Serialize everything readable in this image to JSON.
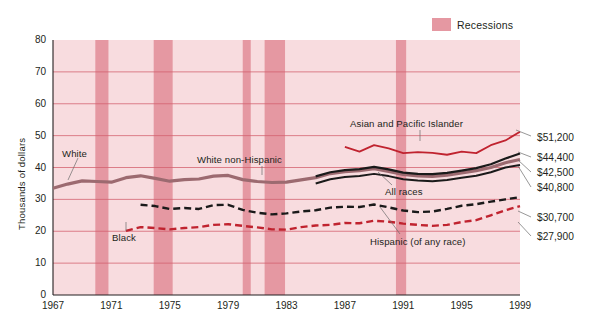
{
  "legend": {
    "label": "Recessions",
    "swatch_color": "#e598a2",
    "position": "top-right"
  },
  "axes": {
    "ylabel": "Thousands of dollars",
    "yticks": [
      0,
      10,
      20,
      30,
      40,
      50,
      60,
      70,
      80
    ],
    "xticks": [
      1967,
      1971,
      1975,
      1979,
      1983,
      1987,
      1991,
      1995,
      1999
    ],
    "ylim": [
      0,
      80
    ],
    "xlim": [
      1967,
      1999
    ],
    "grid": true
  },
  "colors": {
    "plot_background": "#f8dcdf",
    "recession_band": "#e598a2",
    "gridline": "#d4606e",
    "white_series": "#9c6a70",
    "white_non_hispanic_series": "#1a1a1a",
    "all_races_series": "#1a1a1a",
    "asian_series": "#c0232f",
    "black_series": "#1a1a1a",
    "hispanic_series": "#c0232f"
  },
  "end_values": {
    "asian": "$51,200",
    "white_non_hispanic": "$44,400",
    "white": "$42,500",
    "all_races": "$40,800",
    "black": "$30,700",
    "hispanic": "$27,900"
  },
  "series_labels": {
    "white": "White",
    "white_non_hispanic": "White non-Hispanic",
    "asian": "Asian and Pacific Islander",
    "all_races": "All races",
    "black": "Black",
    "hispanic": "Hispanic (of any race)"
  },
  "chart_data": {
    "type": "line",
    "title": "",
    "xlabel": "",
    "ylabel": "Thousands of dollars",
    "xlim": [
      1967,
      1999
    ],
    "ylim": [
      0,
      80
    ],
    "grid": true,
    "legend_position": "top-right",
    "x": [
      1967,
      1968,
      1969,
      1970,
      1971,
      1972,
      1973,
      1974,
      1975,
      1976,
      1977,
      1978,
      1979,
      1980,
      1981,
      1982,
      1983,
      1984,
      1985,
      1986,
      1987,
      1988,
      1989,
      1990,
      1991,
      1992,
      1993,
      1994,
      1995,
      1996,
      1997,
      1998,
      1999
    ],
    "recessions": [
      {
        "start": 1969.9,
        "end": 1970.8
      },
      {
        "start": 1973.9,
        "end": 1975.2
      },
      {
        "start": 1980.0,
        "end": 1980.55
      },
      {
        "start": 1981.5,
        "end": 1982.9
      },
      {
        "start": 1990.5,
        "end": 1991.2
      }
    ],
    "series": [
      {
        "name": "White",
        "style": "solid",
        "color": "#9c6a70",
        "width": 3.2,
        "end_label": "$42,500",
        "values": [
          33.5,
          34.8,
          35.8,
          35.6,
          35.4,
          36.8,
          37.4,
          36.6,
          35.7,
          36.2,
          36.4,
          37.3,
          37.5,
          36.2,
          35.6,
          35.3,
          35.4,
          36.1,
          36.8,
          38.1,
          38.7,
          39.0,
          39.6,
          38.8,
          37.8,
          37.4,
          37.2,
          37.6,
          38.3,
          39.0,
          40.0,
          41.5,
          42.5
        ]
      },
      {
        "name": "White non-Hispanic",
        "style": "solid",
        "color": "#1a1a1a",
        "width": 2.2,
        "end_label": "$44,400",
        "values": [
          null,
          null,
          null,
          null,
          null,
          null,
          null,
          null,
          null,
          null,
          null,
          null,
          null,
          null,
          null,
          null,
          null,
          null,
          37.2,
          38.5,
          39.2,
          39.5,
          40.2,
          39.4,
          38.4,
          38.0,
          37.9,
          38.3,
          39.0,
          39.8,
          41.0,
          42.8,
          44.4
        ]
      },
      {
        "name": "All races",
        "style": "solid",
        "color": "#1a1a1a",
        "width": 2.0,
        "end_label": "$40,800",
        "values": [
          null,
          null,
          null,
          null,
          null,
          null,
          null,
          null,
          null,
          null,
          null,
          null,
          null,
          null,
          null,
          null,
          null,
          null,
          35.0,
          36.3,
          37.0,
          37.3,
          38.0,
          37.3,
          36.3,
          35.9,
          35.7,
          36.1,
          36.8,
          37.4,
          38.5,
          40.0,
          40.8
        ]
      },
      {
        "name": "Asian and Pacific Islander",
        "style": "solid",
        "color": "#c0232f",
        "width": 1.8,
        "end_label": "$51,200",
        "values": [
          null,
          null,
          null,
          null,
          null,
          null,
          null,
          null,
          null,
          null,
          null,
          null,
          null,
          null,
          null,
          null,
          null,
          null,
          null,
          null,
          46.5,
          45.0,
          47.0,
          46.0,
          44.5,
          44.8,
          44.6,
          44.0,
          45.0,
          44.5,
          47.0,
          48.5,
          51.2
        ]
      },
      {
        "name": "Black",
        "style": "dashed",
        "color": "#1a1a1a",
        "width": 2.4,
        "end_label": "$30,700",
        "values": [
          null,
          null,
          null,
          null,
          null,
          null,
          28.3,
          27.9,
          27.0,
          27.3,
          27.0,
          28.2,
          28.3,
          26.7,
          25.8,
          25.3,
          25.6,
          26.2,
          26.6,
          27.4,
          27.7,
          27.6,
          28.4,
          27.5,
          26.5,
          26.0,
          26.2,
          27.0,
          28.0,
          28.5,
          29.3,
          30.0,
          30.7
        ]
      },
      {
        "name": "Hispanic (of any race)",
        "style": "dashed",
        "color": "#c0232f",
        "width": 2.4,
        "end_label": "$27,900",
        "values": [
          null,
          null,
          null,
          null,
          null,
          20.1,
          21.3,
          21.0,
          20.6,
          21.0,
          21.3,
          22.0,
          22.2,
          21.7,
          21.2,
          20.6,
          20.5,
          21.3,
          21.8,
          22.0,
          22.6,
          22.5,
          23.3,
          23.0,
          22.4,
          22.0,
          21.7,
          22.0,
          22.9,
          23.5,
          25.0,
          26.6,
          27.9
        ]
      }
    ]
  }
}
